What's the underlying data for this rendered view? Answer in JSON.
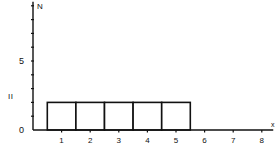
{
  "chart_data": {
    "type": "bar",
    "title": "",
    "xlabel": "x",
    "ylabel": "N",
    "side_label": "II",
    "categories": [
      "1",
      "2",
      "3",
      "4",
      "5"
    ],
    "values": [
      2,
      2,
      2,
      2,
      2
    ],
    "bar_edges": [
      0.5,
      1.5,
      2.5,
      3.5,
      4.5,
      5.5
    ],
    "x_ticks": [
      1,
      2,
      3,
      4,
      5,
      6,
      7,
      8
    ],
    "y_ticks": [
      0,
      1,
      2,
      3,
      4,
      5,
      6,
      7,
      8,
      9
    ],
    "y_tick_labels": {
      "0": "0",
      "5": "5"
    },
    "xlim": [
      0,
      8.4
    ],
    "ylim": [
      0,
      9.3
    ],
    "grid": false,
    "bar_fill": "#ffffff",
    "bar_stroke": "#111111"
  }
}
